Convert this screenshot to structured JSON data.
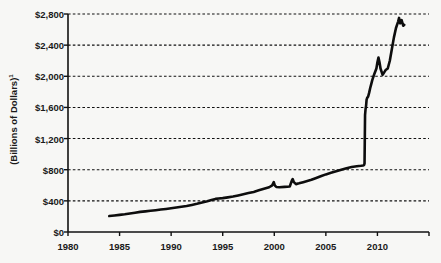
{
  "chart_data": {
    "type": "line",
    "title": "",
    "xlabel": "",
    "ylabel": "(Billions of Dollars)",
    "ylabel_note": "1",
    "xlim": [
      1980,
      2015
    ],
    "ylim": [
      0,
      2800
    ],
    "grid": true,
    "legend": "none",
    "y_ticks": [
      0,
      400,
      800,
      1200,
      1600,
      2000,
      2400,
      2800
    ],
    "y_tick_labels": [
      "$0",
      "$400",
      "$800",
      "$1,200",
      "$1,600",
      "$2,000",
      "$2,400",
      "$2,800"
    ],
    "x_ticks": [
      1980,
      1985,
      1990,
      1995,
      2000,
      2005,
      2010
    ],
    "x_tick_labels": [
      "1980",
      "1985",
      "1990",
      "1995",
      "2000",
      "2005",
      "2010"
    ],
    "series": [
      {
        "name": "Total Assets",
        "x": [
          1984.0,
          1984.5,
          1985.0,
          1985.5,
          1986.0,
          1986.5,
          1987.0,
          1987.5,
          1988.0,
          1988.5,
          1989.0,
          1989.5,
          1990.0,
          1990.5,
          1991.0,
          1991.5,
          1992.0,
          1992.5,
          1993.0,
          1993.5,
          1994.0,
          1994.3,
          1994.6,
          1995.0,
          1995.5,
          1996.0,
          1996.5,
          1997.0,
          1997.5,
          1998.0,
          1998.5,
          1999.0,
          1999.5,
          1999.8,
          1999.95,
          2000.05,
          2000.2,
          2000.5,
          2001.0,
          2001.5,
          2001.7,
          2001.78,
          2001.9,
          2002.1,
          2002.4,
          2002.8,
          2003.2,
          2003.6,
          2004.0,
          2004.5,
          2005.0,
          2005.5,
          2006.0,
          2006.5,
          2007.0,
          2007.5,
          2008.0,
          2008.4,
          2008.6,
          2008.7,
          2008.75,
          2008.8,
          2008.85,
          2008.9,
          2008.95,
          2009.0,
          2009.1,
          2009.2,
          2009.3,
          2009.4,
          2009.5,
          2009.7,
          2009.9,
          2010.0,
          2010.1,
          2010.2,
          2010.3,
          2010.4,
          2010.5,
          2010.6,
          2010.7,
          2010.8,
          2010.9,
          2011.0,
          2011.2,
          2011.4,
          2011.6,
          2011.8,
          2012.0,
          2012.1,
          2012.2,
          2012.35,
          2012.5,
          2012.6
        ],
        "y": [
          205,
          212,
          220,
          228,
          238,
          248,
          258,
          265,
          272,
          280,
          288,
          296,
          305,
          315,
          325,
          335,
          348,
          362,
          378,
          395,
          415,
          425,
          430,
          435,
          445,
          455,
          470,
          485,
          500,
          515,
          535,
          555,
          575,
          600,
          640,
          600,
          578,
          575,
          580,
          585,
          660,
          680,
          640,
          615,
          625,
          640,
          655,
          670,
          690,
          715,
          740,
          760,
          780,
          800,
          820,
          835,
          845,
          850,
          855,
          860,
          880,
          1500,
          1580,
          1620,
          1700,
          1720,
          1740,
          1790,
          1850,
          1900,
          1950,
          2030,
          2100,
          2180,
          2240,
          2180,
          2100,
          2060,
          2020,
          2040,
          2060,
          2080,
          2090,
          2100,
          2200,
          2350,
          2500,
          2620,
          2700,
          2750,
          2680,
          2720,
          2650,
          2660
        ]
      }
    ]
  },
  "axes": {
    "plot_left_px": 68,
    "plot_right_px": 429,
    "plot_top_px": 14,
    "plot_bottom_px": 232
  }
}
